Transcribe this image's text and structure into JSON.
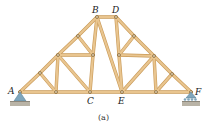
{
  "diagram": {
    "type": "roof truss",
    "caption": "(a)",
    "colors": {
      "member": "#e9c58f",
      "member_edge": "#c99a58",
      "pin": "#7a5a2a",
      "support": "#7fa6bd",
      "ground": "#b9b3a6"
    },
    "labels": {
      "A": "A",
      "B": "B",
      "C": "C",
      "D": "D",
      "E": "E",
      "F": "F"
    },
    "nodes": {
      "A": [
        20,
        92
      ],
      "n1": [
        40,
        73
      ],
      "n2": [
        58,
        55
      ],
      "n3": [
        78,
        36
      ],
      "B": [
        97,
        17
      ],
      "D": [
        116,
        17
      ],
      "n4": [
        134,
        36
      ],
      "n5": [
        154,
        56
      ],
      "n6": [
        172,
        74
      ],
      "F": [
        191,
        92
      ],
      "b1": [
        56,
        92
      ],
      "C": [
        90,
        92
      ],
      "E": [
        122,
        92
      ],
      "b2": [
        156,
        92
      ],
      "m1": [
        93,
        55
      ],
      "m2": [
        119,
        55
      ]
    },
    "members": [
      [
        "A",
        "n1"
      ],
      [
        "n1",
        "n2"
      ],
      [
        "n2",
        "n3"
      ],
      [
        "n3",
        "B"
      ],
      [
        "B",
        "D"
      ],
      [
        "D",
        "n4"
      ],
      [
        "n4",
        "n5"
      ],
      [
        "n5",
        "n6"
      ],
      [
        "n6",
        "F"
      ],
      [
        "A",
        "b1"
      ],
      [
        "b1",
        "C"
      ],
      [
        "C",
        "E"
      ],
      [
        "E",
        "b2"
      ],
      [
        "b2",
        "F"
      ],
      [
        "n1",
        "b1"
      ],
      [
        "b1",
        "n2"
      ],
      [
        "n2",
        "C"
      ],
      [
        "n2",
        "m1"
      ],
      [
        "n3",
        "m1"
      ],
      [
        "B",
        "m1"
      ],
      [
        "m1",
        "C"
      ],
      [
        "B",
        "E"
      ],
      [
        "D",
        "m2"
      ],
      [
        "m2",
        "E"
      ],
      [
        "n4",
        "m2"
      ],
      [
        "m2",
        "n5"
      ],
      [
        "n5",
        "E"
      ],
      [
        "n5",
        "b2"
      ],
      [
        "b2",
        "n6"
      ]
    ]
  }
}
